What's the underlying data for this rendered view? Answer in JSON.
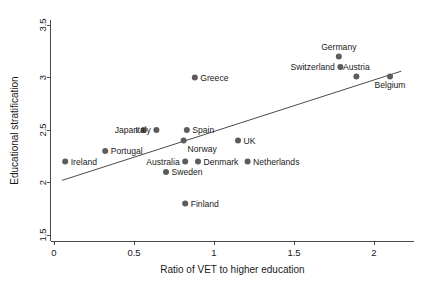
{
  "chart_data": {
    "type": "scatter",
    "title": "",
    "xlabel": "Ratio of VET to higher education",
    "ylabel": "Educational stratification",
    "xlim": [
      -0.02,
      2.25
    ],
    "ylim": [
      1.44,
      3.55
    ],
    "xticks": [
      0,
      0.5,
      1,
      1.5,
      2
    ],
    "xticklabels": [
      "0",
      "0.5",
      "1",
      "1.5",
      "2"
    ],
    "yticks": [
      1.5,
      2,
      2.5,
      3,
      3.5
    ],
    "yticklabels": [
      "1.5",
      "2",
      "2.5",
      "3",
      "3.5"
    ],
    "grid": false,
    "legend": false,
    "marker_color": "#5c5c5c",
    "line_color": "#4a4a4a",
    "points": [
      {
        "label": "Ireland",
        "x": 0.07,
        "y": 2.2,
        "label_side": "right"
      },
      {
        "label": "Portugal",
        "x": 0.32,
        "y": 2.3,
        "label_side": "right"
      },
      {
        "label": "Japan",
        "x": 0.56,
        "y": 2.5,
        "label_side": "left"
      },
      {
        "label": "Italy",
        "x": 0.64,
        "y": 2.5,
        "label_side": "left"
      },
      {
        "label": "Sweden",
        "x": 0.7,
        "y": 2.1,
        "label_side": "right"
      },
      {
        "label": "Australia",
        "x": 0.82,
        "y": 2.2,
        "label_side": "left"
      },
      {
        "label": "Norway",
        "x": 0.81,
        "y": 2.4,
        "label_side": "rightbelow"
      },
      {
        "label": "Finland",
        "x": 0.82,
        "y": 1.8,
        "label_side": "right"
      },
      {
        "label": "Spain",
        "x": 0.83,
        "y": 2.5,
        "label_side": "right"
      },
      {
        "label": "Greece",
        "x": 0.88,
        "y": 3.0,
        "label_side": "right"
      },
      {
        "label": "Denmark",
        "x": 0.9,
        "y": 2.2,
        "label_side": "right"
      },
      {
        "label": "UK",
        "x": 1.15,
        "y": 2.4,
        "label_side": "right"
      },
      {
        "label": "Netherlands",
        "x": 1.21,
        "y": 2.2,
        "label_side": "right"
      },
      {
        "label": "Switzerland",
        "x": 1.79,
        "y": 3.1,
        "label_side": "left"
      },
      {
        "label": "Germany",
        "x": 1.78,
        "y": 3.2,
        "label_side": "above"
      },
      {
        "label": "Austria",
        "x": 1.89,
        "y": 3.01,
        "label_side": "above"
      },
      {
        "label": "Belgium",
        "x": 2.1,
        "y": 3.01,
        "label_side": "below"
      }
    ],
    "fit_line": {
      "x0": 0.05,
      "y0": 2.02,
      "x1": 2.17,
      "y1": 3.06
    }
  },
  "axes": {
    "x_title": "Ratio of VET to higher education",
    "y_title": "Educational stratification",
    "x_tick_0": "0",
    "x_tick_1": "0.5",
    "x_tick_2": "1",
    "x_tick_3": "1.5",
    "x_tick_4": "2",
    "y_tick_0": "1.5",
    "y_tick_1": "2",
    "y_tick_2": "2.5",
    "y_tick_3": "3",
    "y_tick_4": "3.5"
  }
}
